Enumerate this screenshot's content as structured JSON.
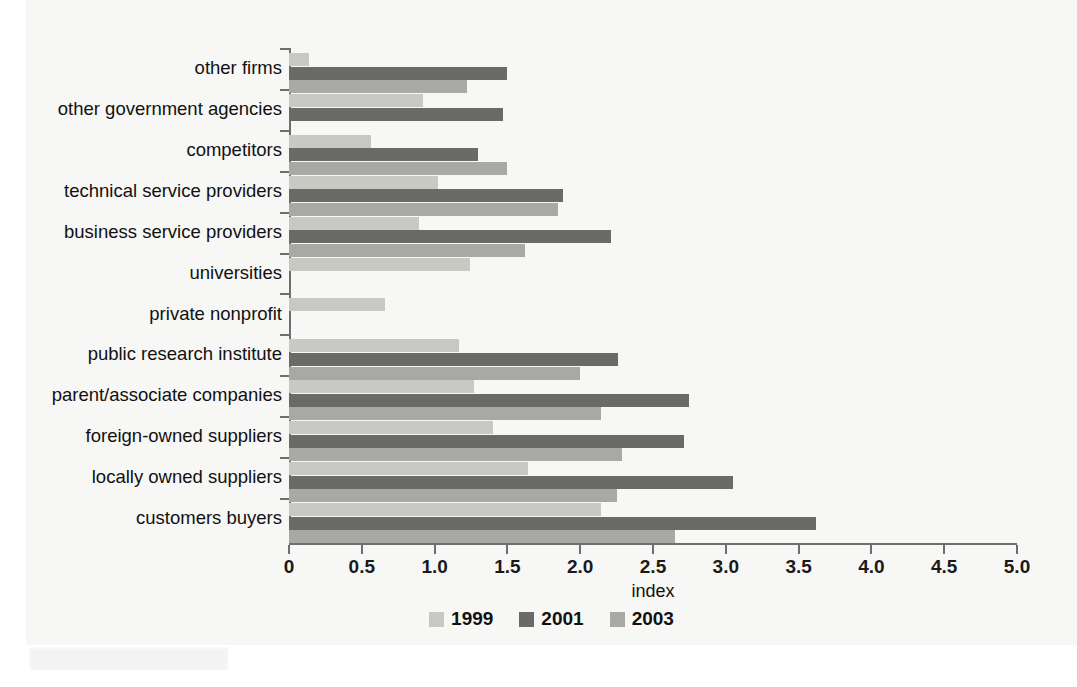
{
  "figure": {
    "axis_title": "index",
    "background": "#f7f7f5",
    "colors": {
      "y1999": "#c9c9c4",
      "y2001": "#6a6a68",
      "y2003": "#a8a8a4",
      "axis": "#6e6e6e",
      "text": "#111111"
    }
  },
  "legend": {
    "items": [
      {
        "label": "1999",
        "key": "y1999",
        "color": "#c9c9c4"
      },
      {
        "label": "2001",
        "key": "y2001",
        "color": "#6a6a68"
      },
      {
        "label": "2003",
        "key": "y2003",
        "color": "#a8a8a4"
      }
    ]
  },
  "chart_data": {
    "type": "bar",
    "orientation": "horizontal",
    "title": "",
    "subtitle": "",
    "xlabel": "index",
    "ylabel": "",
    "xlim": [
      0,
      5.0
    ],
    "xticks": [
      0,
      0.5,
      1.0,
      1.5,
      2.0,
      2.5,
      3.0,
      3.5,
      4.0,
      4.5,
      5.0
    ],
    "xtick_labels": [
      "0",
      "0.5",
      "1.0",
      "1.5",
      "2.0",
      "2.5",
      "3.0",
      "3.5",
      "4.0",
      "4.5",
      "5.0"
    ],
    "grid": false,
    "legend_position": "bottom-center",
    "categories": [
      "other firms",
      "other government agencies",
      "competitors",
      "technical service providers",
      "business service providers",
      "universities",
      "private nonprofit",
      "public research institute",
      "parent/associate companies",
      "foreign-owned suppliers",
      "locally owned suppliers",
      "customers buyers"
    ],
    "series": [
      {
        "name": "1999",
        "color": "#c9c9c4",
        "values": [
          0.14,
          0.92,
          0.56,
          1.02,
          0.89,
          1.24,
          0.66,
          1.17,
          1.27,
          1.4,
          1.64,
          2.14
        ]
      },
      {
        "name": "2001",
        "color": "#6a6a68",
        "values": [
          1.5,
          1.47,
          1.3,
          1.88,
          2.21,
          0,
          0,
          2.26,
          2.75,
          2.71,
          3.05,
          3.62
        ]
      },
      {
        "name": "2003",
        "color": "#a8a8a4",
        "values": [
          1.22,
          0,
          1.5,
          1.85,
          1.62,
          0,
          0,
          2.0,
          2.14,
          2.29,
          2.25,
          2.65
        ]
      }
    ]
  }
}
